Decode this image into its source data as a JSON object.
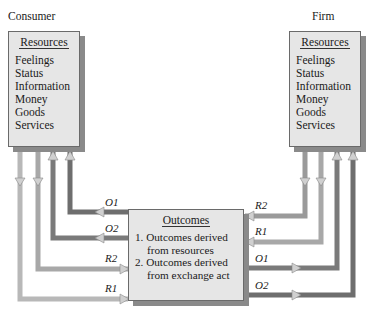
{
  "consumer": {
    "title": "Consumer",
    "box_header": "Resources",
    "resources": [
      "Feelings",
      "Status",
      "Information",
      "Money",
      "Goods",
      "Services"
    ]
  },
  "firm": {
    "title": "Firm",
    "box_header": "Resources",
    "resources": [
      "Feelings",
      "Status",
      "Information",
      "Money",
      "Goods",
      "Services"
    ]
  },
  "outcomes": {
    "header": "Outcomes",
    "items": [
      {
        "line1": "1. Outcomes derived",
        "line2": "from resources"
      },
      {
        "line1": "2. Outcomes derived",
        "line2": "from exchange act"
      }
    ]
  },
  "flows": {
    "left": {
      "o1": "O1",
      "o2": "O2",
      "r2": "R2",
      "r1": "R1"
    },
    "right": {
      "r2": "R2",
      "r1": "R1",
      "o1": "O1",
      "o2": "O2"
    }
  },
  "colors": {
    "box_fill": "#e6e6e6",
    "box_shadow": "#8a8a8a",
    "arrow_dark": "#6e6e6e",
    "arrow_light": "#c8c8c8"
  }
}
